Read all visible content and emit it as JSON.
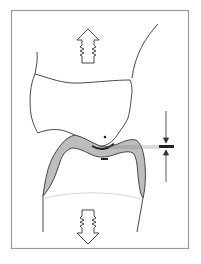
{
  "diagram": {
    "type": "dental-occlusion-illustration",
    "colors": {
      "frame": "#9a9a9a",
      "outline": "#333333",
      "enamel_fill": "#bdbdbd",
      "contact_mark": "#222222",
      "cej_line": "#cfcfcf"
    },
    "elements": {
      "upper_arrow": {
        "direction": "up",
        "symbol": "spring-arrow"
      },
      "lower_arrow": {
        "direction": "down",
        "symbol": "spring-arrow"
      },
      "upper_tooth": {
        "label": ""
      },
      "lower_tooth": {
        "label": ""
      },
      "measurement": {
        "symbol": "thickness-gauge",
        "label": ""
      }
    }
  }
}
